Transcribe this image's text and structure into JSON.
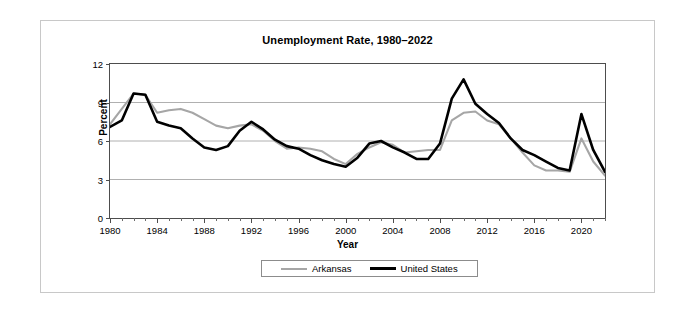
{
  "figure": {
    "title": "Unemployment Rate, 1980–2022"
  },
  "axes": {
    "y_label": "Percent",
    "x_label": "Year",
    "y_ticks": [
      "0",
      "3",
      "6",
      "9",
      "12"
    ],
    "x_ticks": [
      "1980",
      "1984",
      "1988",
      "1992",
      "1996",
      "2000",
      "2004",
      "2008",
      "2012",
      "2016",
      "2020"
    ]
  },
  "legend": {
    "items": [
      {
        "label": "Arkansas",
        "color": "#a6a6a6"
      },
      {
        "label": "United States",
        "color": "#000000"
      }
    ]
  },
  "colors": {
    "arkansas": "#a6a6a6",
    "united_states": "#000000",
    "gridline": "#b0b0b0",
    "axis": "#4d4d4d",
    "frame": "#c8c8c8"
  },
  "chart_data": {
    "type": "line",
    "title": "Unemployment Rate, 1980–2022",
    "xlabel": "Year",
    "ylabel": "Percent",
    "xlim": [
      1980,
      2022
    ],
    "ylim": [
      0,
      12
    ],
    "ytick_values": [
      0,
      3,
      6,
      9,
      12
    ],
    "xtick_values": [
      1980,
      1984,
      1988,
      1992,
      1996,
      2000,
      2004,
      2008,
      2012,
      2016,
      2020
    ],
    "xtick_minor_step": 1,
    "grid": "horizontal",
    "legend_position": "below-axes-center",
    "x": [
      1980,
      1981,
      1982,
      1983,
      1984,
      1985,
      1986,
      1987,
      1988,
      1989,
      1990,
      1991,
      1992,
      1993,
      1994,
      1995,
      1996,
      1997,
      1998,
      1999,
      2000,
      2001,
      2002,
      2003,
      2004,
      2005,
      2006,
      2007,
      2008,
      2009,
      2010,
      2011,
      2012,
      2013,
      2014,
      2015,
      2016,
      2017,
      2018,
      2019,
      2020,
      2021,
      2022
    ],
    "series": [
      {
        "name": "Arkansas",
        "color": "#a6a6a6",
        "values": [
          7.3,
          8.5,
          9.7,
          9.6,
          8.2,
          8.4,
          8.5,
          8.2,
          7.7,
          7.2,
          7.0,
          7.2,
          7.3,
          6.8,
          6.0,
          5.4,
          5.5,
          5.4,
          5.2,
          4.6,
          4.2,
          5.0,
          5.5,
          5.9,
          5.7,
          5.1,
          5.2,
          5.3,
          5.3,
          7.6,
          8.2,
          8.3,
          7.6,
          7.3,
          6.2,
          5.1,
          4.1,
          3.7,
          3.7,
          3.6,
          6.2,
          4.4,
          3.3
        ]
      },
      {
        "name": "United States",
        "color": "#000000",
        "values": [
          7.1,
          7.6,
          9.7,
          9.6,
          7.5,
          7.2,
          7.0,
          6.2,
          5.5,
          5.3,
          5.6,
          6.8,
          7.5,
          6.9,
          6.1,
          5.6,
          5.4,
          4.9,
          4.5,
          4.2,
          4.0,
          4.7,
          5.8,
          6.0,
          5.5,
          5.1,
          4.6,
          4.6,
          5.8,
          9.3,
          10.8,
          8.9,
          8.1,
          7.4,
          6.2,
          5.3,
          4.9,
          4.4,
          3.9,
          3.7,
          8.1,
          5.3,
          3.6
        ]
      }
    ]
  }
}
